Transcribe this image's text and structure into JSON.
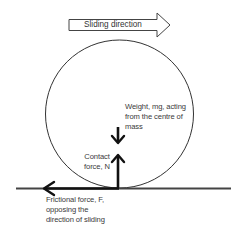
{
  "diagram": {
    "sliding_direction": {
      "label": "Sliding direction",
      "icon": "right-arrow-outline"
    },
    "ball": {
      "shape": "circle",
      "stroke": "#333333"
    },
    "forces": {
      "weight": {
        "lines": [
          "Weight, mg, acting",
          "from the centre of",
          "mass"
        ],
        "direction": "down"
      },
      "contact": {
        "lines": [
          "Contact",
          "force, N"
        ],
        "direction": "up"
      },
      "friction": {
        "lines": [
          "Frictional force, F,",
          "opposing the",
          "direction of sliding"
        ],
        "direction": "left"
      }
    },
    "ground": {
      "color": "#444444"
    },
    "colors": {
      "background": "#ffffff",
      "lines": "#111111",
      "text": "#3a3a3a"
    }
  }
}
